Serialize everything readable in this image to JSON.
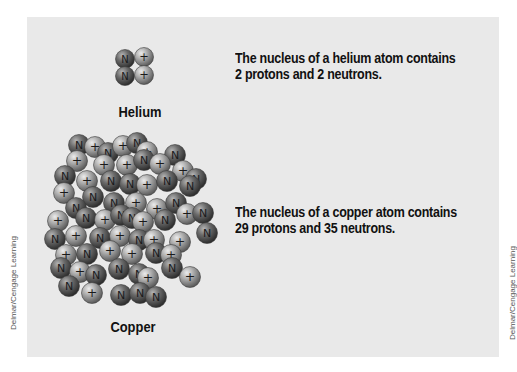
{
  "helium": {
    "label": "Helium",
    "caption_line1": "The nucleus of a helium atom contains",
    "caption_line2": "2 protons and 2 neutrons.",
    "protons": 2,
    "neutrons": 2
  },
  "copper": {
    "label": "Copper",
    "caption_line1": "The nucleus of a copper atom contains",
    "caption_line2": "29 protons and 35 neutrons.",
    "protons": 29,
    "neutrons": 35
  },
  "legend": {
    "neutron_symbol": "N",
    "proton_symbol": "+"
  },
  "credits": {
    "left": "Delmar/Cengage Learning",
    "right": "Delmar/Cengage Learning"
  },
  "colors": {
    "panel": "#e9e9e9",
    "neutron": "#5f5f5f",
    "proton": "#a3a3a3",
    "text": "#111111"
  }
}
